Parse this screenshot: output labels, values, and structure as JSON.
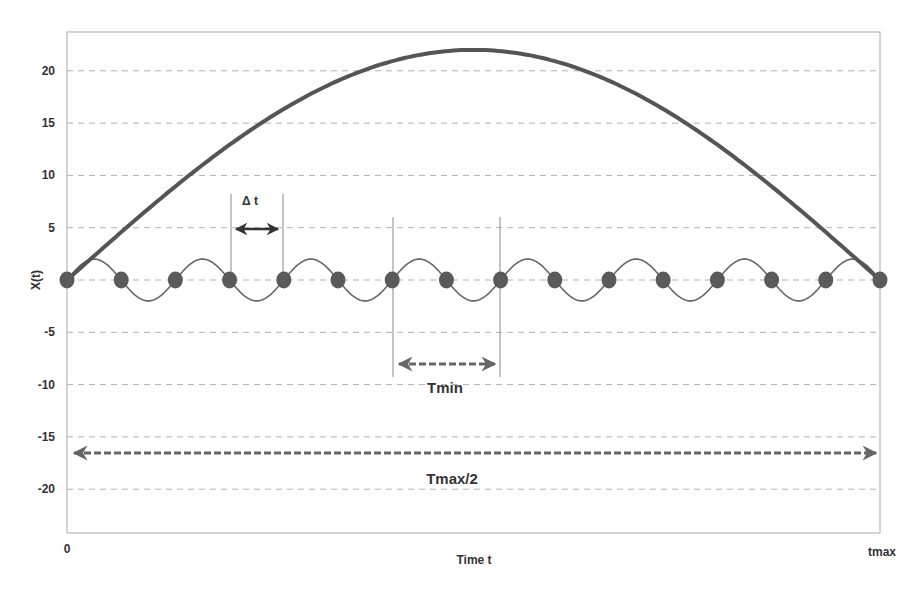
{
  "chart_data": {
    "type": "line",
    "title": "",
    "xlabel": "Time t",
    "ylabel": "X(t)",
    "x_tick_labels": [
      "0",
      "tmax"
    ],
    "y_ticks": [
      20,
      15,
      10,
      5,
      0,
      -5,
      -10,
      -15,
      -20
    ],
    "y_tick_labels": [
      "20",
      "15",
      "10",
      "5",
      "0",
      "-5",
      "-10",
      "-15",
      "-20"
    ],
    "ylim": [
      -24,
      24
    ],
    "xlim": [
      0,
      1
    ],
    "grid": {
      "horizontal": true,
      "style": "dashed"
    },
    "series": [
      {
        "name": "slow mode (half period of Tmax)",
        "style": "thick solid",
        "formula": "22*sin(pi*t)",
        "x": [
          0,
          0.1,
          0.2,
          0.3,
          0.4,
          0.5,
          0.6,
          0.7,
          0.8,
          0.9,
          1.0
        ],
        "values": [
          0,
          6.8,
          12.9,
          17.8,
          20.9,
          22,
          20.9,
          17.8,
          12.9,
          6.8,
          0
        ]
      },
      {
        "name": "fast mode (period Tmin)",
        "style": "thin solid",
        "formula": "2*sin(2*pi*7.5*t)",
        "amplitude": 2,
        "cycles": 7.5
      },
      {
        "name": "sample points",
        "style": "markers",
        "x": [
          0,
          0.0667,
          0.1333,
          0.2,
          0.2667,
          0.3333,
          0.4,
          0.4667,
          0.5333,
          0.6,
          0.6667,
          0.7333,
          0.8,
          0.8667,
          0.9333,
          1.0
        ],
        "values": [
          0,
          0,
          0,
          0,
          0,
          0,
          0,
          0,
          0,
          0,
          0,
          0,
          0,
          0,
          0,
          0
        ]
      }
    ],
    "annotations": [
      {
        "text": "Δ t",
        "type": "double-arrow solid",
        "from_x": 0.2,
        "to_x": 0.2667,
        "y": 5
      },
      {
        "text": "Tmin",
        "type": "double-arrow dashed",
        "from_x": 0.4,
        "to_x": 0.5333,
        "y": -8
      },
      {
        "text": "Tmax/2",
        "type": "double-arrow dashed",
        "from_x": 0,
        "to_x": 1.0,
        "y": -16.5
      }
    ]
  },
  "colors": {
    "curve": "#555555",
    "wave": "#666666",
    "marker": "#5a5a5a",
    "grid": "#b0b0b0",
    "axis": "#999999",
    "text": "#333333"
  }
}
